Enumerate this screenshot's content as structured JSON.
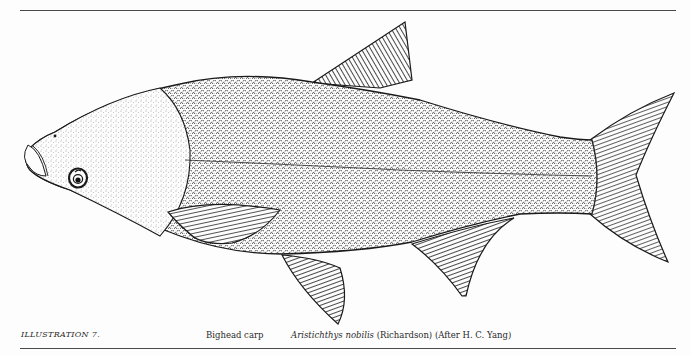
{
  "figure": {
    "ink_color": "#1a1a1a",
    "paper_color": "#fdfdfd"
  },
  "caption": {
    "label": "ILLUSTRATION 7.",
    "common_name": "Bighead carp",
    "scientific_genus_species": "Aristichthys nobilis",
    "authority": "(Richardson)",
    "credit": "(After H. C. Yang)"
  }
}
